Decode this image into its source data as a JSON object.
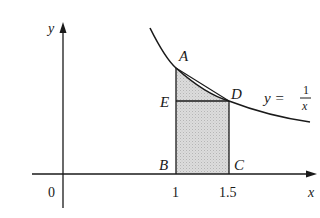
{
  "diagram": {
    "curve_label": {
      "lhs": "y =",
      "num": "1",
      "den": "x"
    },
    "axes": {
      "x_label": "x",
      "y_label": "y",
      "origin_label": "0"
    },
    "ticks": [
      {
        "value": 1,
        "label": "1"
      },
      {
        "value": 1.5,
        "label": "1.5"
      }
    ],
    "points": {
      "A": {
        "label": "A",
        "x": 1,
        "y": 1
      },
      "B": {
        "label": "B",
        "x": 1,
        "y": 0
      },
      "C": {
        "label": "C",
        "x": 1.5,
        "y": 0
      },
      "D": {
        "label": "D",
        "x": 1.5,
        "y": 0.667
      },
      "E": {
        "label": "E",
        "x": 1,
        "y": 0.667
      }
    },
    "colors": {
      "line": "#1a1a1a",
      "shade": "#d0d0d0"
    }
  }
}
